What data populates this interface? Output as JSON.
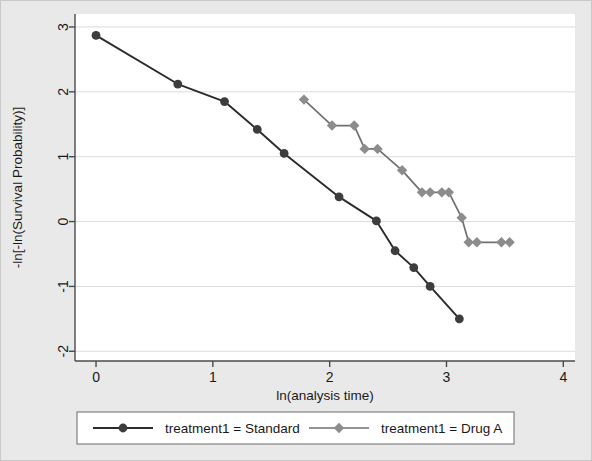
{
  "chart_data": {
    "type": "line",
    "title": "",
    "xlabel": "ln(analysis time)",
    "ylabel": "-ln[-ln(Survival Probability)]",
    "xlim": [
      -0.18,
      4.1
    ],
    "ylim": [
      -2.15,
      3.2
    ],
    "xticks": [
      0,
      1,
      2,
      3,
      4
    ],
    "yticks": [
      -2,
      -1,
      0,
      1,
      2,
      3
    ],
    "xtick_labels": [
      "0",
      "1",
      "2",
      "3",
      "4"
    ],
    "ytick_labels": [
      "-2",
      "-1",
      "0",
      "1",
      "2",
      "3"
    ],
    "grid": true,
    "grid_axis": "y",
    "legend_position": "bottom",
    "series": [
      {
        "name": "treatment1 = Standard",
        "marker": "circle",
        "color": "#3d3d3d",
        "line_color": "#2b2b2b",
        "points": [
          {
            "x": 0.0,
            "y": 2.87
          },
          {
            "x": 0.7,
            "y": 2.12
          },
          {
            "x": 1.1,
            "y": 1.85
          },
          {
            "x": 1.38,
            "y": 1.42
          },
          {
            "x": 1.61,
            "y": 1.05
          },
          {
            "x": 2.08,
            "y": 0.38
          },
          {
            "x": 2.4,
            "y": 0.01
          },
          {
            "x": 2.56,
            "y": -0.45
          },
          {
            "x": 2.72,
            "y": -0.71
          },
          {
            "x": 2.86,
            "y": -1.0
          },
          {
            "x": 3.11,
            "y": -1.5
          }
        ]
      },
      {
        "name": "treatment1 = Drug A",
        "marker": "diamond",
        "color": "#8c8c8c",
        "line_color": "#707070",
        "points": [
          {
            "x": 1.78,
            "y": 1.88
          },
          {
            "x": 2.02,
            "y": 1.48
          },
          {
            "x": 2.21,
            "y": 1.48
          },
          {
            "x": 2.3,
            "y": 1.12
          },
          {
            "x": 2.41,
            "y": 1.12
          },
          {
            "x": 2.62,
            "y": 0.79
          },
          {
            "x": 2.79,
            "y": 0.45
          },
          {
            "x": 2.86,
            "y": 0.45
          },
          {
            "x": 2.96,
            "y": 0.45
          },
          {
            "x": 3.02,
            "y": 0.45
          },
          {
            "x": 3.13,
            "y": 0.06
          },
          {
            "x": 3.19,
            "y": -0.32
          },
          {
            "x": 3.26,
            "y": -0.32
          },
          {
            "x": 3.47,
            "y": -0.32
          },
          {
            "x": 3.54,
            "y": -0.32
          }
        ]
      }
    ]
  },
  "legend": {
    "entries": [
      {
        "label": "treatment1 = Standard",
        "marker": "circle",
        "color": "#3d3d3d"
      },
      {
        "label": "treatment1 = Drug A",
        "marker": "diamond",
        "color": "#8c8c8c"
      }
    ]
  }
}
